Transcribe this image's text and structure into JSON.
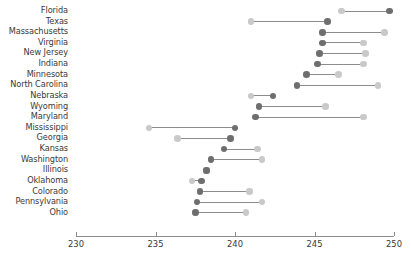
{
  "chart_data": {
    "type": "scatter",
    "subtype": "dumbbell",
    "title": "",
    "xlabel": "",
    "ylabel": "",
    "xlim": [
      230,
      250
    ],
    "xticks": [
      230,
      235,
      240,
      245,
      250
    ],
    "xtick_labels": [
      "230",
      "235",
      "240",
      "245",
      "250"
    ],
    "grid": false,
    "legend": false,
    "series": [
      {
        "name": "start",
        "color": "#6e6e6e"
      },
      {
        "name": "end",
        "color": "#c9c9c9"
      }
    ],
    "categories": [
      "Florida",
      "Texas",
      "Massachusetts",
      "Virginia",
      "New Jersey",
      "Indiana",
      "Minnesota",
      "North Carolina",
      "Nebraska",
      "Wyoming",
      "Maryland",
      "Mississippi",
      "Georgia",
      "Kansas",
      "Washington",
      "Illinois",
      "Oklahoma",
      "Colorado",
      "Pennsylvania",
      "Ohio"
    ],
    "rows": [
      {
        "category": "Florida",
        "start": 249.7,
        "end": 246.7
      },
      {
        "category": "Texas",
        "start": 245.8,
        "end": 241.0
      },
      {
        "category": "Massachusetts",
        "start": 245.5,
        "end": 249.4
      },
      {
        "category": "Virginia",
        "start": 245.5,
        "end": 248.1
      },
      {
        "category": "New Jersey",
        "start": 245.3,
        "end": 248.2
      },
      {
        "category": "Indiana",
        "start": 245.2,
        "end": 248.1
      },
      {
        "category": "Minnesota",
        "start": 244.5,
        "end": 246.5
      },
      {
        "category": "North Carolina",
        "start": 243.9,
        "end": 249.0
      },
      {
        "category": "Nebraska",
        "start": 242.4,
        "end": 241.0
      },
      {
        "category": "Wyoming",
        "start": 241.5,
        "end": 245.7
      },
      {
        "category": "Maryland",
        "start": 241.3,
        "end": 248.1
      },
      {
        "category": "Mississippi",
        "start": 240.0,
        "end": 234.6
      },
      {
        "category": "Georgia",
        "start": 239.7,
        "end": 236.4
      },
      {
        "category": "Kansas",
        "start": 239.3,
        "end": 241.4
      },
      {
        "category": "Washington",
        "start": 238.5,
        "end": 241.7
      },
      {
        "category": "Illinois",
        "start": 238.2,
        "end": 238.2
      },
      {
        "category": "Oklahoma",
        "start": 237.9,
        "end": 237.3
      },
      {
        "category": "Colorado",
        "start": 237.8,
        "end": 240.9
      },
      {
        "category": "Pennsylvania",
        "start": 237.6,
        "end": 241.7
      },
      {
        "category": "Ohio",
        "start": 237.5,
        "end": 240.7
      }
    ]
  },
  "colors": {
    "start_dot": "#6e6e6e",
    "end_dot": "#c9c9c9",
    "connector": "#8d8d8d",
    "axis": "#8d8d8d",
    "text": "#3a3a3a"
  }
}
